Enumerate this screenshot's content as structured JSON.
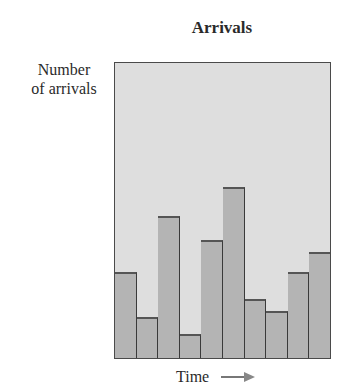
{
  "chart_data": {
    "type": "bar",
    "title": "Arrivals",
    "xlabel": "Time",
    "ylabel": "Number of arrivals",
    "ylabel_lines": [
      "Number",
      "of arrivals"
    ],
    "categories": [
      "1",
      "2",
      "3",
      "4",
      "5",
      "6",
      "7",
      "8",
      "9",
      "10"
    ],
    "values": [
      29,
      14,
      48,
      8,
      40,
      58,
      20,
      16,
      29,
      36
    ],
    "value_units": "percent of plot height (no numeric axis shown)",
    "ylim": [
      0,
      100
    ],
    "grid": false,
    "legend": null,
    "x_axis_arrow": true,
    "colors": {
      "plot_background": "#dedede",
      "bar_fill": "#b4b4b4",
      "bar_edge": "#3a3a3a"
    }
  }
}
